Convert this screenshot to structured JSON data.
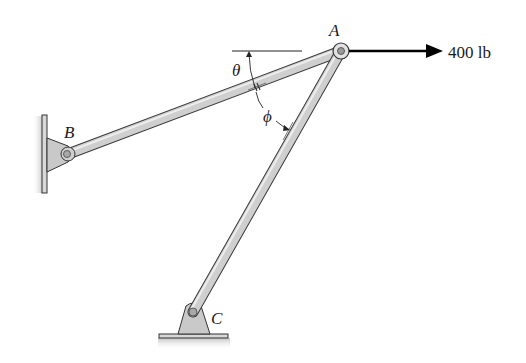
{
  "figure": {
    "labels": {
      "point_a": "A",
      "point_b": "B",
      "point_c": "C",
      "angle_theta": "θ",
      "angle_phi": "ϕ",
      "force": "400 lb"
    },
    "colors": {
      "member_fill": "#cfcfcf",
      "member_stroke": "#3a3a3a",
      "support_fill": "#c9c9c9",
      "arrow": "#000000",
      "ground_shadow": "#bdbdbd"
    },
    "members": [
      {
        "name": "AB",
        "from": "B",
        "to": "A"
      },
      {
        "name": "AC",
        "from": "C",
        "to": "A"
      }
    ],
    "supports": [
      {
        "point": "B",
        "type": "pin on vertical wall"
      },
      {
        "point": "C",
        "type": "pin on floor"
      }
    ],
    "load": {
      "point": "A",
      "direction": "right",
      "magnitude": "400 lb"
    }
  }
}
